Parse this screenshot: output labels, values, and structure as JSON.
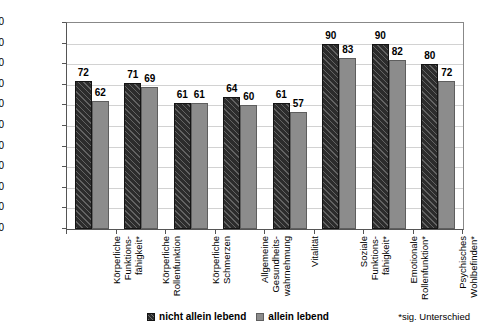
{
  "chart_data": {
    "type": "bar",
    "title": "",
    "xlabel": "",
    "ylabel": "SF-36 Skalenwert",
    "ylim": [
      0,
      100
    ],
    "ytick_step": 10,
    "yticks": [
      0,
      10,
      20,
      30,
      40,
      50,
      60,
      70,
      80,
      90,
      100
    ],
    "grid": true,
    "legend_position": "bottom",
    "categories": [
      "Körperliche\nFunktions-\nfähigkeit*",
      "Körperliche\nRollenfunktion",
      "Körperliche\nSchmerzen",
      "Allgemeine\nGesundheits-\nwahrnehmung",
      "Vitalität",
      "Soziale\nFunktions-\nfähigkeit*",
      "Emotionale\nRollenfunktion*",
      "Psychisches\nWohlbefinden*"
    ],
    "series": [
      {
        "name": "nicht allein lebend",
        "color": "#2c2c2c",
        "pattern": "diagonal-hatch",
        "values": [
          72,
          71,
          61,
          64,
          61,
          90,
          90,
          80
        ]
      },
      {
        "name": "allein lebend",
        "color": "#8c8c8c",
        "pattern": "solid",
        "values": [
          62,
          69,
          61,
          60,
          57,
          83,
          82,
          72
        ]
      }
    ],
    "annotations": [
      "*sig. Unterschied"
    ]
  },
  "footnote": "*sig. Unterschied",
  "legend": {
    "items": [
      {
        "label": "nicht allein lebend"
      },
      {
        "label": "allein lebend"
      }
    ]
  }
}
